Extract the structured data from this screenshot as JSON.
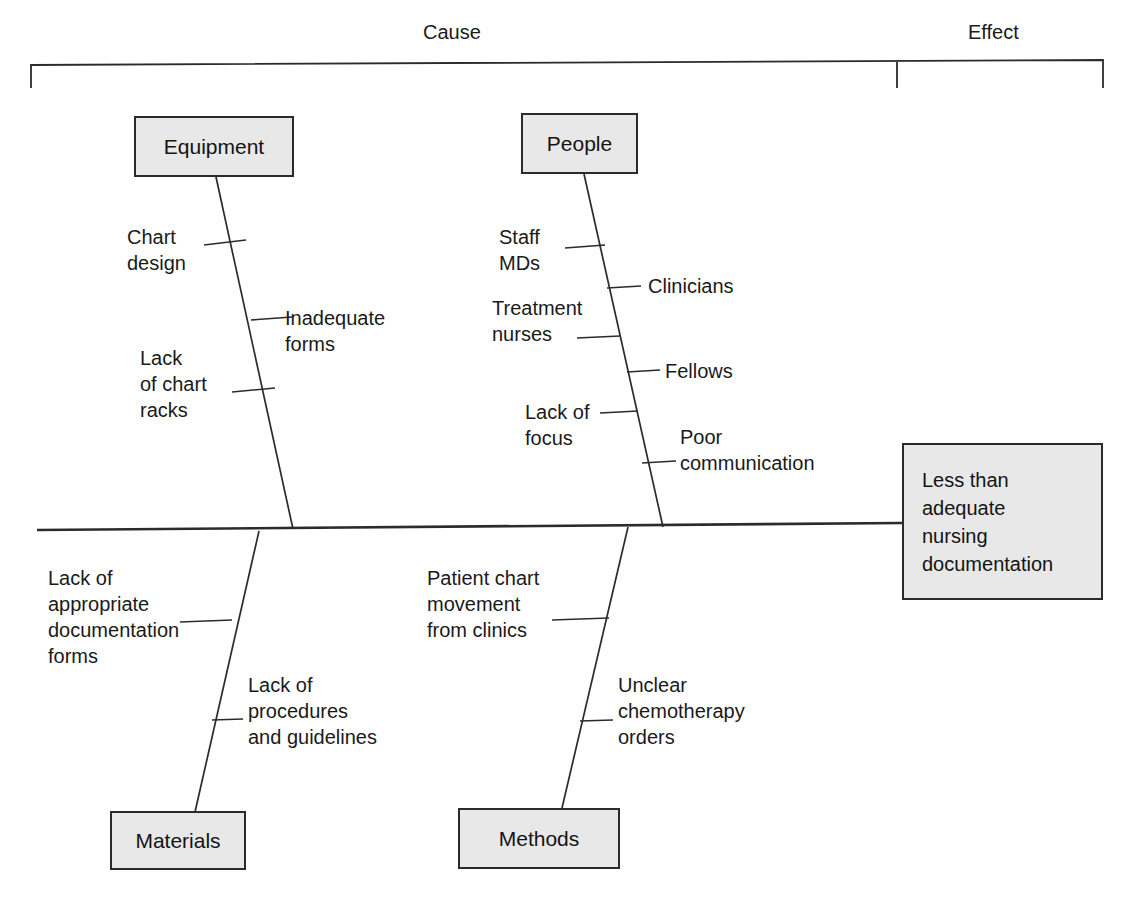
{
  "diagram": {
    "type": "fishbone-cause-and-effect",
    "header": {
      "cause_label": "Cause",
      "effect_label": "Effect"
    },
    "effect": {
      "lines": [
        "Less than",
        "adequate",
        "nursing",
        "documentation"
      ]
    },
    "categories": [
      {
        "id": "equipment",
        "label": "Equipment",
        "position": "top-left"
      },
      {
        "id": "people",
        "label": "People",
        "position": "top-right"
      },
      {
        "id": "materials",
        "label": "Materials",
        "position": "bottom-left"
      },
      {
        "id": "methods",
        "label": "Methods",
        "position": "bottom-right"
      }
    ],
    "causes": {
      "equipment": [
        {
          "text": "Chart\ndesign",
          "side": "left"
        },
        {
          "text": "Inadequate\nforms",
          "side": "right"
        },
        {
          "text": "Lack\nof chart\nracks",
          "side": "left"
        }
      ],
      "people": [
        {
          "text": "Staff\nMDs",
          "side": "left"
        },
        {
          "text": "Clinicians",
          "side": "right"
        },
        {
          "text": "Treatment\nnurses",
          "side": "left"
        },
        {
          "text": "Fellows",
          "side": "right"
        },
        {
          "text": "Lack of\nfocus",
          "side": "left"
        },
        {
          "text": "Poor\ncommunication",
          "side": "right"
        }
      ],
      "materials": [
        {
          "text": "Lack of\nappropriate\ndocumentation\nforms",
          "side": "left"
        },
        {
          "text": "Lack of\nprocedures\nand guidelines",
          "side": "right"
        }
      ],
      "methods": [
        {
          "text": "Patient chart\nmovement\nfrom clinics",
          "side": "left"
        },
        {
          "text": "Unclear\nchemotherapy\norders",
          "side": "right"
        }
      ]
    },
    "colors": {
      "line": "#2b2b2b",
      "box_fill": "#e8e8e8",
      "text": "#1a1a1a",
      "background": "#ffffff"
    }
  }
}
